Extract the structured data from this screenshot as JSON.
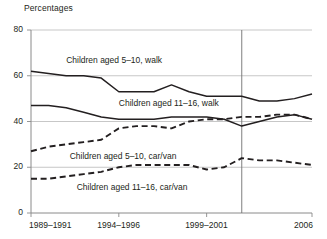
{
  "chart_data": {
    "type": "line",
    "title": "",
    "ylabel": "Percentages",
    "xlabel": "",
    "ylim": [
      0,
      80
    ],
    "yticks": [
      0,
      20,
      40,
      60,
      80
    ],
    "grid": true,
    "legend_position": "inline-annotations",
    "xtick_labels": [
      "1989–1991",
      "1994–1996",
      "1999–2001",
      "2006"
    ],
    "xtick_values": [
      1990,
      1995,
      2000,
      2006
    ],
    "annotations": [
      {
        "text": "Children aged 5–10, walk",
        "x": 1992.0,
        "y": 66.5
      },
      {
        "text": "Children aged 11–16, walk",
        "x": 1995.0,
        "y": 47.5
      },
      {
        "text": "Children aged 5–10, car/van",
        "x": 1992.2,
        "y": 24.5
      },
      {
        "text": "Children aged 11–16, car/van",
        "x": 1992.6,
        "y": 11.0
      }
    ],
    "vertical_rule": {
      "x": 2002.0,
      "label": ""
    },
    "x": [
      1990,
      1991,
      1992,
      1993,
      1994,
      1995,
      1996,
      1997,
      1998,
      1999,
      2000,
      2001,
      2002,
      2003,
      2004,
      2005,
      2006
    ],
    "series": [
      {
        "name": "Children aged 5–10, walk",
        "style": "solid",
        "color": "#231f20",
        "values": [
          62,
          61,
          60,
          60,
          59,
          53,
          53,
          53,
          56,
          53,
          51,
          51,
          51,
          49,
          49,
          50,
          52
        ]
      },
      {
        "name": "Children aged 11–16, walk",
        "style": "solid",
        "color": "#231f20",
        "values": [
          47,
          47,
          46,
          44,
          42,
          41,
          41,
          41,
          42,
          42,
          42,
          41,
          38,
          40,
          42,
          43,
          41
        ]
      },
      {
        "name": "Children aged 5–10, car/van",
        "style": "dashed",
        "color": "#231f20",
        "values": [
          27,
          29,
          30,
          31,
          32,
          37,
          38,
          38,
          37,
          40,
          41,
          41,
          42,
          42,
          43,
          43,
          41
        ]
      },
      {
        "name": "Children aged 11–16, car/van",
        "style": "dashed",
        "color": "#231f20",
        "values": [
          15,
          15,
          16,
          17,
          18,
          20,
          21,
          21,
          21,
          21,
          19,
          20,
          24,
          23,
          23,
          22,
          21
        ]
      }
    ]
  }
}
